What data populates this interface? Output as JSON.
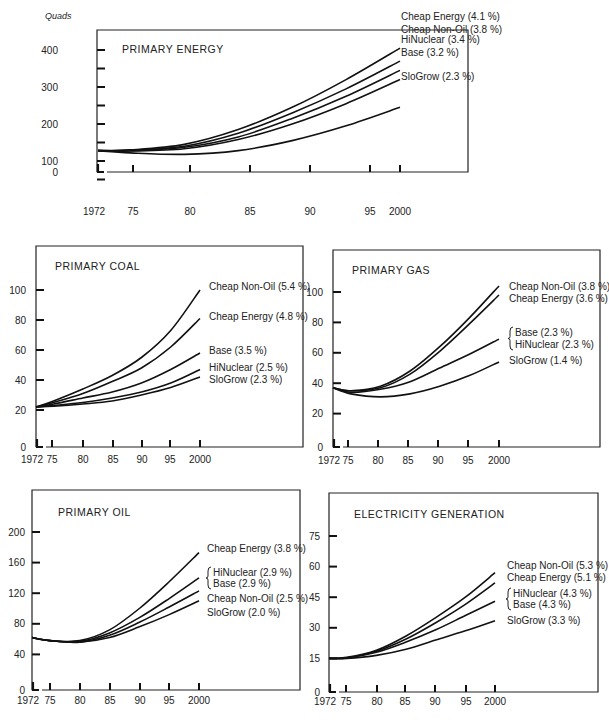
{
  "page": {
    "unit_label": "Quads"
  },
  "chart_data": [
    {
      "id": "primary-energy",
      "type": "line",
      "title": "PRIMARY ENERGY",
      "ylabel": "Quads",
      "xlabel": "",
      "x": [
        1972,
        1975,
        1980,
        1985,
        1990,
        1995,
        2000
      ],
      "x_tick_labels": [
        "1972",
        "75",
        "80",
        "85",
        "90",
        "95",
        "2000"
      ],
      "y_ticks": [
        0,
        100,
        200,
        300,
        400
      ],
      "y_tick_labels": [
        "0",
        "100",
        "200",
        "300",
        "400"
      ],
      "ylim": [
        0,
        450
      ],
      "grid": false,
      "legend_position": "right-end-of-lines",
      "series": [
        {
          "name": "Cheap Energy (4.1 %)",
          "values": [
            128,
            130,
            145,
            185,
            245,
            320,
            405
          ]
        },
        {
          "name": "Cheap Non-Oil (3.8 %)",
          "values": [
            128,
            129,
            140,
            175,
            230,
            295,
            370
          ]
        },
        {
          "name": "HiNuclear (3.4 %)",
          "values": [
            128,
            128,
            137,
            165,
            215,
            275,
            345
          ]
        },
        {
          "name": "Base (3.2 %)",
          "values": [
            128,
            127,
            133,
            158,
            200,
            255,
            320
          ]
        },
        {
          "name": "SloGrow (2.3 %)",
          "values": [
            128,
            122,
            118,
            128,
            155,
            195,
            245
          ]
        }
      ]
    },
    {
      "id": "primary-coal",
      "type": "line",
      "title": "PRIMARY COAL",
      "x": [
        1972,
        1975,
        1980,
        1985,
        1990,
        1995,
        2000
      ],
      "x_tick_labels": [
        "1972",
        "75",
        "80",
        "85",
        "90",
        "95",
        "2000"
      ],
      "y_ticks": [
        0,
        20,
        40,
        60,
        80,
        100
      ],
      "y_tick_labels": [
        "0",
        "20",
        "40",
        "60",
        "80",
        "100"
      ],
      "ylim": [
        0,
        120
      ],
      "grid": false,
      "series": [
        {
          "name": "Cheap Non-Oil (5.4 %)",
          "values": [
            22,
            26,
            34,
            43,
            55,
            73,
            100
          ]
        },
        {
          "name": "Cheap Energy (4.8 %)",
          "values": [
            22,
            25,
            31,
            39,
            48,
            62,
            81
          ]
        },
        {
          "name": "Base (3.5 %)",
          "values": [
            22,
            24,
            28,
            32,
            38,
            47,
            58
          ]
        },
        {
          "name": "HiNuclear (2.5 %)",
          "values": [
            22,
            23,
            25,
            28,
            32,
            38,
            47
          ]
        },
        {
          "name": "SloGrow (2.3 %)",
          "values": [
            22,
            22.5,
            24,
            26,
            30,
            35,
            42
          ]
        }
      ]
    },
    {
      "id": "primary-gas",
      "type": "line",
      "title": "PRIMARY GAS",
      "x": [
        1972,
        1975,
        1980,
        1985,
        1990,
        1995,
        2000
      ],
      "x_tick_labels": [
        "1972",
        "75",
        "80",
        "85",
        "90",
        "95",
        "2000"
      ],
      "y_ticks": [
        0,
        20,
        40,
        60,
        80,
        100
      ],
      "y_tick_labels": [
        "0",
        "20",
        "40",
        "60",
        "80",
        "100"
      ],
      "ylim": [
        0,
        120
      ],
      "grid": false,
      "series": [
        {
          "name": "Cheap Non-Oil (3.8 %)",
          "values": [
            37,
            35,
            38,
            48,
            64,
            83,
            104
          ]
        },
        {
          "name": "Cheap Energy (3.6 %)",
          "values": [
            37,
            35,
            37,
            46,
            61,
            79,
            98
          ]
        },
        {
          "name": "Base (2.3 %) / HiNuclear (2.3 %)",
          "values": [
            37,
            34,
            36,
            41,
            50,
            59,
            69
          ]
        },
        {
          "name": "SloGrow (1.4 %)",
          "values": [
            37,
            33,
            31,
            33,
            38,
            45,
            54
          ]
        }
      ]
    },
    {
      "id": "primary-oil",
      "type": "line",
      "title": "PRIMARY OIL",
      "x": [
        1972,
        1975,
        1980,
        1985,
        1990,
        1995,
        2000
      ],
      "x_tick_labels": [
        "1972",
        "75",
        "80",
        "85",
        "90",
        "95",
        "2000"
      ],
      "y_ticks": [
        0,
        40,
        80,
        120,
        160,
        200
      ],
      "y_tick_labels": [
        "0",
        "40",
        "80",
        "120",
        "160",
        "200"
      ],
      "ylim": [
        0,
        230
      ],
      "grid": false,
      "series": [
        {
          "name": "Cheap Energy (3.8 %)",
          "values": [
            62,
            58,
            58,
            72,
            100,
            135,
            173
          ]
        },
        {
          "name": "HiNuclear (2.9 %) / Base (2.9 %)",
          "values": [
            62,
            58,
            57,
            68,
            88,
            113,
            140
          ]
        },
        {
          "name": "Cheap Non-Oil (2.5 %)",
          "values": [
            62,
            58,
            56,
            65,
            82,
            102,
            123
          ]
        },
        {
          "name": "SloGrow (2.0 %)",
          "values": [
            62,
            58,
            56,
            62,
            76,
            92,
            110
          ]
        }
      ]
    },
    {
      "id": "electricity-generation",
      "type": "line",
      "title": "ELECTRICITY GENERATION",
      "x": [
        1972,
        1975,
        1980,
        1985,
        1990,
        1995,
        2000
      ],
      "x_tick_labels": [
        "1972",
        "75",
        "80",
        "85",
        "90",
        "95",
        "2000"
      ],
      "y_ticks": [
        0,
        15,
        30,
        45,
        60,
        75
      ],
      "y_tick_labels": [
        "0",
        "15",
        "30",
        "45",
        "60",
        "75"
      ],
      "ylim": [
        0,
        85
      ],
      "grid": false,
      "series": [
        {
          "name": "Cheap Non-Oil (5.3 %)",
          "values": [
            15,
            15.5,
            19,
            26,
            35,
            45,
            57
          ]
        },
        {
          "name": "Cheap Energy (5.1 %)",
          "values": [
            15,
            15.3,
            18.5,
            24.5,
            32.5,
            41.5,
            52
          ]
        },
        {
          "name": "HiNuclear (4.3 %) / Base (4.3 %)",
          "values": [
            15,
            15.2,
            18,
            23,
            29,
            36,
            43
          ]
        },
        {
          "name": "SloGrow (3.3 %)",
          "values": [
            15,
            15,
            16.5,
            19.5,
            24,
            28.5,
            33.5
          ]
        }
      ]
    }
  ]
}
